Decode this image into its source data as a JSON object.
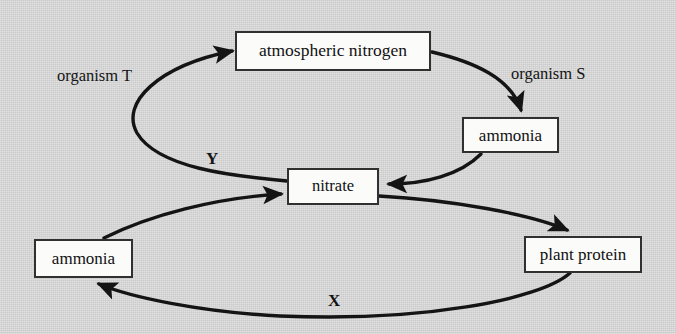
{
  "diagram": {
    "type": "cycle-flow-diagram",
    "background_color": "#d9d9d9",
    "box_fill_color": "#fbfbfa",
    "box_border_color": "#303030",
    "arrow_color": "#141414",
    "nodes": [
      {
        "id": "atmospheric_nitrogen",
        "label": "atmospheric nitrogen"
      },
      {
        "id": "ammonia_right",
        "label": "ammonia"
      },
      {
        "id": "nitrate",
        "label": "nitrate"
      },
      {
        "id": "ammonia_left",
        "label": "ammonia"
      },
      {
        "id": "plant_protein",
        "label": "plant protein"
      }
    ],
    "edge_labels": [
      {
        "id": "organism_t",
        "label": "organism T"
      },
      {
        "id": "organism_s",
        "label": "organism S"
      },
      {
        "id": "process_y",
        "label": "Y"
      },
      {
        "id": "process_x",
        "label": "X"
      }
    ],
    "edges": [
      {
        "from": "nitrate",
        "to": "atmospheric_nitrogen",
        "label": "organism T"
      },
      {
        "from": "atmospheric_nitrogen",
        "to": "ammonia_right",
        "label": "organism S"
      },
      {
        "from": "ammonia_right",
        "to": "nitrate",
        "label": ""
      },
      {
        "from": "ammonia_left",
        "to": "nitrate",
        "label": ""
      },
      {
        "from": "nitrate",
        "to": "plant_protein",
        "label": ""
      },
      {
        "from": "plant_protein",
        "to": "ammonia_left",
        "label": "X"
      }
    ]
  }
}
